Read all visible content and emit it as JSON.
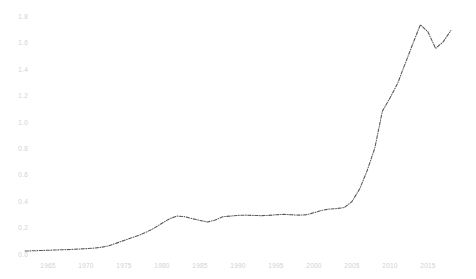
{
  "chart_data": {
    "type": "line",
    "title": "",
    "subtitle": "",
    "xlabel": "",
    "ylabel": "",
    "xlim": [
      1962,
      2018
    ],
    "ylim": [
      0.0,
      1.85
    ],
    "grid": false,
    "legend": false,
    "legend_position": "none",
    "line_style": "dash-dot",
    "line_color": "#585858",
    "tick_label_color": "#d2d2d2",
    "background_color": "#ffffff",
    "xticks": [
      1965,
      1970,
      1975,
      1980,
      1985,
      1990,
      1995,
      2000,
      2005,
      2010,
      2015
    ],
    "xtick_labels": [
      "1965",
      "1970",
      "1975",
      "1980",
      "1985",
      "1990",
      "1995",
      "2000",
      "2005",
      "2010",
      "2015"
    ],
    "yticks": [
      0.0,
      0.2,
      0.4,
      0.6,
      0.8,
      1.0,
      1.2,
      1.4,
      1.6,
      1.8
    ],
    "ytick_labels": [
      "0.0",
      "0.2",
      "0.4",
      "0.6",
      "0.8",
      "1.0",
      "1.2",
      "1.4",
      "1.6",
      "1.8"
    ],
    "series": [
      {
        "name": "series-1",
        "x": [
          1962,
          1963,
          1964,
          1965,
          1966,
          1967,
          1968,
          1969,
          1970,
          1971,
          1972,
          1973,
          1974,
          1975,
          1976,
          1977,
          1978,
          1979,
          1980,
          1981,
          1982,
          1983,
          1984,
          1985,
          1986,
          1987,
          1988,
          1989,
          1990,
          1991,
          1992,
          1993,
          1994,
          1995,
          1996,
          1997,
          1998,
          1999,
          2000,
          2001,
          2002,
          2003,
          2004,
          2005,
          2006,
          2007,
          2008,
          2009,
          2010,
          2011,
          2012,
          2013,
          2014,
          2015,
          2016,
          2017,
          2018
        ],
        "y": [
          0.03,
          0.032,
          0.034,
          0.036,
          0.038,
          0.04,
          0.042,
          0.045,
          0.048,
          0.052,
          0.058,
          0.07,
          0.09,
          0.11,
          0.13,
          0.15,
          0.175,
          0.205,
          0.24,
          0.275,
          0.295,
          0.29,
          0.275,
          0.262,
          0.25,
          0.265,
          0.29,
          0.295,
          0.3,
          0.302,
          0.3,
          0.298,
          0.3,
          0.305,
          0.308,
          0.305,
          0.302,
          0.305,
          0.32,
          0.338,
          0.348,
          0.352,
          0.36,
          0.405,
          0.5,
          0.64,
          0.81,
          1.09,
          1.19,
          1.3,
          1.45,
          1.6,
          1.745,
          1.69,
          1.565,
          1.615,
          1.7
        ]
      }
    ]
  }
}
